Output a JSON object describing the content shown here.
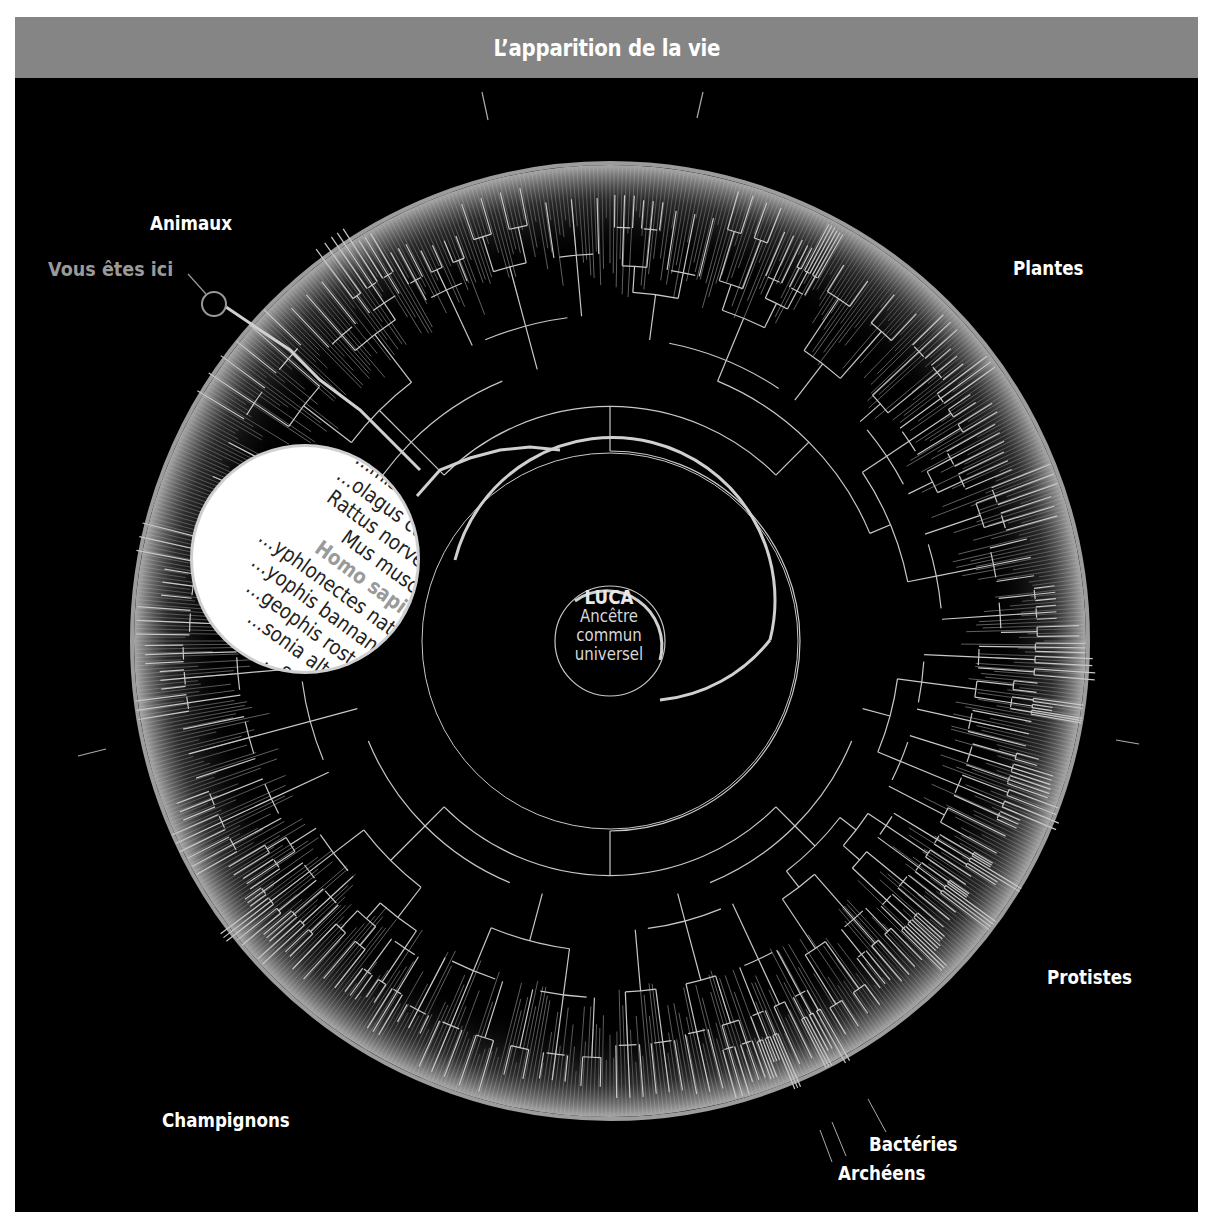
{
  "header": {
    "title": "L’apparition de la vie"
  },
  "center": {
    "title": "LUCA",
    "lines": [
      "Ancêtre",
      "commun",
      "universel"
    ]
  },
  "labels": {
    "animals": "Animaux",
    "you_are_here": "Vous êtes ici",
    "plants": "Plantes",
    "protists": "Protistes",
    "fungi": "Champignons",
    "bacteria": "Bactéries",
    "archaea": "Archéens"
  },
  "magnifier": {
    "species": [
      "…mississippiensis",
      "…olagus cuniculus",
      "Rattus norvegicus",
      "Mus musculus",
      "Homo sapiens",
      "…yphlonectes natans",
      "…yophis bannanicus",
      "…geophis rostratus",
      "…sonia alternans",
      "…ssus pictus"
    ],
    "highlighted": "Homo sapiens"
  },
  "colors": {
    "header_bg": "#858585",
    "background": "#000000",
    "branch": "#c8c8c8",
    "highlight": "#9a9a9a",
    "label": "#ffffff"
  },
  "chart_data": {
    "type": "radial-tree",
    "title": "L’apparition de la vie",
    "root": "LUCA — Ancêtre commun universel",
    "groups": [
      "Animaux",
      "Plantes",
      "Protistes",
      "Bactéries",
      "Archéens",
      "Champignons"
    ],
    "marker": "Vous êtes ici → Homo sapiens"
  }
}
